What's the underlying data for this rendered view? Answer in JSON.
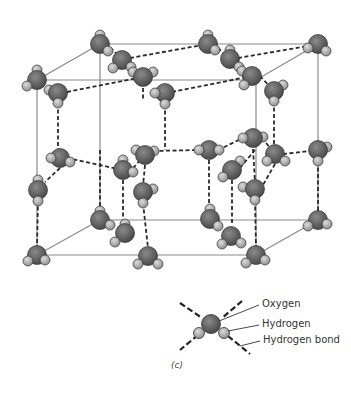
{
  "figure": {
    "caption": "(c)"
  },
  "legend": {
    "items": [
      {
        "key": "oxygen",
        "label": "Oxygen"
      },
      {
        "key": "hydrogen",
        "label": "Hydrogen"
      },
      {
        "key": "hbond",
        "label": "Hydrogen bond"
      }
    ]
  },
  "colors": {
    "oxygen": "#5e5e5e",
    "hydrogen": "#a9a9a9",
    "frame": "#8a8a8a",
    "bond": "#2a2a2a",
    "text": "#333333"
  }
}
